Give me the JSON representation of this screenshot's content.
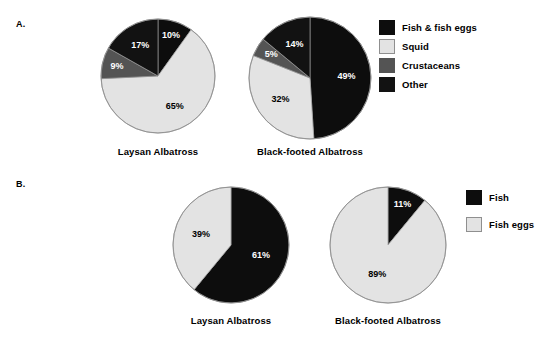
{
  "figure": {
    "panels": [
      {
        "letter": "A.",
        "legend": {
          "entries": [
            {
              "label": "Fish & fish eggs",
              "color": "#0d0d0d"
            },
            {
              "label": "Squid",
              "color": "#e3e3e3"
            },
            {
              "label": "Crustaceans",
              "color": "#545454"
            },
            {
              "label": "Other",
              "color": "#121212"
            }
          ]
        },
        "charts": [
          {
            "caption": "Laysan Albatross"
          },
          {
            "caption": "Black-footed Albatross"
          }
        ]
      },
      {
        "letter": "B.",
        "legend": {
          "entries": [
            {
              "label": "Fish",
              "color": "#0d0d0d"
            },
            {
              "label": "Fish eggs",
              "color": "#e3e3e3"
            }
          ]
        },
        "charts": [
          {
            "caption": "Laysan Albatross"
          },
          {
            "caption": "Black-footed Albatross"
          }
        ]
      }
    ]
  },
  "chart_data": [
    {
      "type": "pie",
      "panel": "A",
      "title": "Laysan Albatross",
      "categories": [
        "Fish & fish eggs",
        "Squid",
        "Crustaceans",
        "Other"
      ],
      "values": [
        10,
        65,
        9,
        17
      ],
      "labels": [
        "10%",
        "65%",
        "9%",
        "17%"
      ],
      "colors": [
        "#0d0d0d",
        "#e3e3e3",
        "#545454",
        "#121212"
      ],
      "start_angle": 0,
      "direction": "clockwise",
      "legend_position": "right"
    },
    {
      "type": "pie",
      "panel": "A",
      "title": "Black-footed Albatross",
      "categories": [
        "Fish & fish eggs",
        "Squid",
        "Crustaceans",
        "Other"
      ],
      "values": [
        49,
        32,
        5,
        14
      ],
      "labels": [
        "49%",
        "32%",
        "5%",
        "14%"
      ],
      "colors": [
        "#0d0d0d",
        "#e3e3e3",
        "#545454",
        "#121212"
      ],
      "start_angle": 0,
      "direction": "clockwise",
      "legend_position": "right"
    },
    {
      "type": "pie",
      "panel": "B",
      "title": "Laysan Albatross",
      "categories": [
        "Fish",
        "Fish eggs"
      ],
      "values": [
        61,
        39
      ],
      "labels": [
        "61%",
        "39%"
      ],
      "colors": [
        "#0d0d0d",
        "#e3e3e3"
      ],
      "start_angle": 0,
      "direction": "clockwise",
      "legend_position": "right"
    },
    {
      "type": "pie",
      "panel": "B",
      "title": "Black-footed Albatross",
      "categories": [
        "Fish",
        "Fish eggs"
      ],
      "values": [
        11,
        89
      ],
      "labels": [
        "11%",
        "89%"
      ],
      "colors": [
        "#0d0d0d",
        "#e3e3e3"
      ],
      "start_angle": 0,
      "direction": "clockwise",
      "legend_position": "right"
    }
  ],
  "layout": {
    "pies": [
      {
        "cx": 158,
        "cy": 76,
        "r": 57,
        "label_r": 0.62
      },
      {
        "cx": 310,
        "cy": 78,
        "r": 61,
        "label_r": 0.6
      },
      {
        "cx": 231,
        "cy": 245,
        "r": 58,
        "label_r": 0.55
      },
      {
        "cx": 388,
        "cy": 245,
        "r": 58,
        "label_r": 0.55
      }
    ],
    "captions": [
      {
        "x": 158,
        "y": 146
      },
      {
        "x": 310,
        "y": 146
      },
      {
        "x": 231,
        "y": 315
      },
      {
        "x": 388,
        "y": 315
      }
    ],
    "legends": [
      {
        "x": 379,
        "y": 20
      },
      {
        "x": 466,
        "y": 190
      }
    ]
  }
}
